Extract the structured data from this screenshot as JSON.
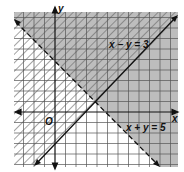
{
  "diagram": {
    "type": "linear-inequality-graph",
    "axes": {
      "x_label": "x",
      "y_label": "y",
      "origin_label": "O"
    },
    "lines": [
      {
        "label": "x − y = 3",
        "style": "solid"
      },
      {
        "label": "x + y = 5",
        "style": "dashed"
      }
    ],
    "colors": {
      "shade": "#b8b8b8",
      "grid": "#555555",
      "hatch": "#666666",
      "line": "#111111"
    }
  }
}
